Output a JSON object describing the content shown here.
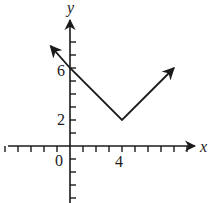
{
  "chart_data": {
    "type": "line",
    "title": "",
    "xlabel": "x",
    "ylabel": "y",
    "function": "y = |x - 4| + 2",
    "x_tick_labels": [
      {
        "value": 0,
        "label": "0"
      },
      {
        "value": 4,
        "label": "4"
      }
    ],
    "y_tick_labels": [
      {
        "value": 2,
        "label": "2"
      },
      {
        "value": 6,
        "label": "6"
      }
    ],
    "xlim": [
      -5,
      12
    ],
    "ylim": [
      -5,
      9
    ],
    "grid": false,
    "series": [
      {
        "name": "f(x)",
        "points": [
          [
            -1.5,
            7.7
          ],
          [
            0,
            6
          ],
          [
            4,
            2
          ],
          [
            8,
            6
          ]
        ],
        "arrows": "both"
      }
    ],
    "key_points": {
      "vertex": [
        4,
        2
      ],
      "y_intercept": [
        0,
        6
      ]
    },
    "colors": {
      "line": "#1a1a1a",
      "axis": "#1a1a1a"
    }
  },
  "labels": {
    "x_axis": "x",
    "y_axis": "y",
    "origin": "0",
    "x_tick_4": "4",
    "y_tick_2": "2",
    "y_tick_6": "6"
  }
}
